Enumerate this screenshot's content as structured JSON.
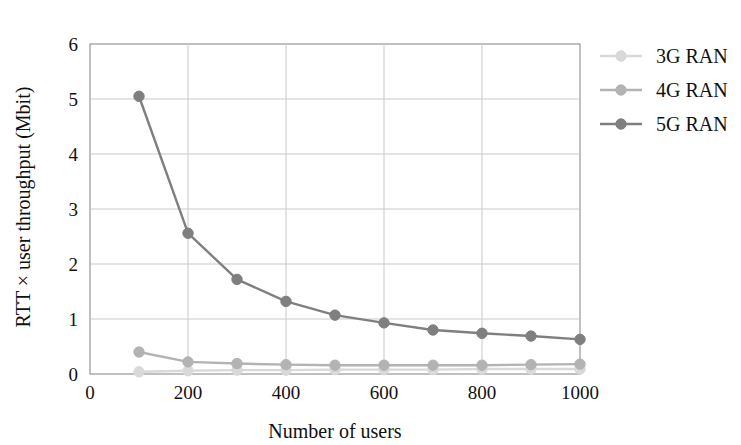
{
  "chart_data": {
    "type": "line",
    "title": "",
    "xlabel": "Number of users",
    "ylabel": "RTT × user throughput (Mbit)",
    "x": [
      100,
      200,
      300,
      400,
      500,
      600,
      700,
      800,
      900,
      1000
    ],
    "xlim": [
      0,
      1000
    ],
    "ylim": [
      0,
      6
    ],
    "xticks": [
      0,
      200,
      400,
      600,
      800,
      1000
    ],
    "yticks": [
      0,
      1,
      2,
      3,
      4,
      5,
      6
    ],
    "xtick_labels": [
      "0",
      "200",
      "400",
      "600",
      "800",
      "1000"
    ],
    "ytick_labels": [
      "0",
      "1",
      "2",
      "3",
      "4",
      "5",
      "6"
    ],
    "grid": true,
    "legend_position": "right",
    "series": [
      {
        "name": "3G RAN",
        "color": "#d9d9d9",
        "values": [
          0.04,
          0.06,
          0.07,
          0.07,
          0.08,
          0.08,
          0.08,
          0.09,
          0.09,
          0.09
        ]
      },
      {
        "name": "4G RAN",
        "color": "#b3b3b3",
        "values": [
          0.4,
          0.22,
          0.19,
          0.17,
          0.16,
          0.16,
          0.16,
          0.16,
          0.17,
          0.18
        ]
      },
      {
        "name": "5G RAN",
        "color": "#7f7f7f",
        "values": [
          5.05,
          2.56,
          1.72,
          1.32,
          1.07,
          0.93,
          0.8,
          0.74,
          0.69,
          0.63
        ]
      }
    ]
  },
  "axes": {
    "x_title": "Number of users",
    "y_title": "RTT × user throughput (Mbit)"
  },
  "legend": {
    "entries": [
      {
        "label": "3G RAN",
        "color": "#d9d9d9"
      },
      {
        "label": "4G RAN",
        "color": "#b3b3b3"
      },
      {
        "label": "5G RAN",
        "color": "#7f7f7f"
      }
    ]
  },
  "style": {
    "grid_color": "#c9c9c9",
    "axis_color": "#8c8c8c",
    "text_color": "#111111",
    "background": "#ffffff"
  }
}
